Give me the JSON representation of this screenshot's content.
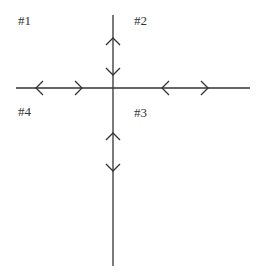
{
  "diagram": {
    "labels": [
      {
        "id": "q1",
        "text": "#1",
        "x": 18,
        "y": 14
      },
      {
        "id": "q2",
        "text": "#2",
        "x": 134,
        "y": 14
      },
      {
        "id": "q3",
        "text": "#3",
        "x": 134,
        "y": 106
      },
      {
        "id": "q4",
        "text": "#4",
        "x": 18,
        "y": 105
      }
    ],
    "axes": {
      "horizontal": {
        "x1": 16,
        "x2": 250,
        "y": 88
      },
      "vertical": {
        "x": 113,
        "y1": 15,
        "y2": 266
      }
    },
    "arrow_markers": [
      {
        "axis": "horizontal",
        "position": 36,
        "direction": "left"
      },
      {
        "axis": "horizontal",
        "position": 82,
        "direction": "right"
      },
      {
        "axis": "horizontal",
        "position": 162,
        "direction": "left"
      },
      {
        "axis": "horizontal",
        "position": 208,
        "direction": "right"
      },
      {
        "axis": "vertical",
        "position": 42,
        "direction": "up"
      },
      {
        "axis": "vertical",
        "position": 72,
        "direction": "down"
      },
      {
        "axis": "vertical",
        "position": 137,
        "direction": "up"
      },
      {
        "axis": "vertical",
        "position": 167,
        "direction": "down"
      }
    ],
    "line_color": "#333333"
  }
}
